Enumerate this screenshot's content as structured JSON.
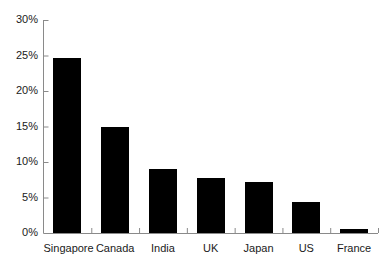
{
  "chart_data": {
    "type": "bar",
    "title": "",
    "subtitle": "",
    "xlabel": "",
    "ylabel": "",
    "categories": [
      "Singapore",
      "Canada",
      "India",
      "UK",
      "Japan",
      "US",
      "France"
    ],
    "values": [
      24.6,
      14.9,
      9.0,
      7.8,
      7.2,
      4.3,
      0.6
    ],
    "value_suffix": "%",
    "ylim": [
      0,
      30
    ],
    "ytick_values": [
      0,
      5,
      10,
      15,
      20,
      25,
      30
    ],
    "ytick_labels": [
      "0%",
      "5%",
      "10%",
      "15%",
      "20%",
      "25%",
      "30%"
    ],
    "grid": false,
    "legend": null,
    "legend_position": "none",
    "bar_color": "#000000",
    "axis_color": "#888888",
    "text_color": "#1a1a1a",
    "background": "#ffffff",
    "annotations": []
  },
  "axes": {
    "x_axis_name": "category-axis",
    "y_axis_name": "percent-axis"
  }
}
